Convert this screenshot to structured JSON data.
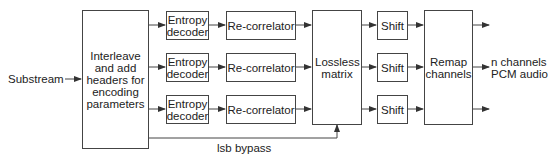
{
  "diagram": {
    "input_label": "Substream",
    "interleave_box": "Interleave and add headers for encoding parameters",
    "entropy_decoders": [
      "Entropy decoder",
      "Entropy decoder",
      "Entropy decoder"
    ],
    "recorrelators": [
      "Re-correlator",
      "Re-correlator",
      "Re-correlator"
    ],
    "lossless_matrix": "Lossless matrix",
    "shifts": [
      "Shift",
      "Shift",
      "Shift"
    ],
    "remap": "Remap channels",
    "output_label_line1": "n channels",
    "output_label_line2": "PCM audio",
    "bypass_label": "lsb bypass",
    "colors": {
      "stroke": "#444444",
      "text": "#222222",
      "background": "#ffffff"
    }
  }
}
